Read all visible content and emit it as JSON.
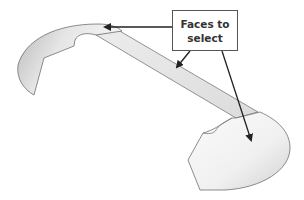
{
  "diagram": {
    "callout": {
      "line1": "Faces to",
      "line2": "select"
    },
    "colors": {
      "face_fill_light": "#f7f7f7",
      "face_fill_dark": "#bdbdbd",
      "edge": "#6e6e6e",
      "arrow": "#222222",
      "callout_border": "#555555",
      "callout_text": "#333333"
    },
    "arrows": [
      {
        "name": "arrow-to-left-face",
        "from": [
          172,
          27
        ],
        "to": [
          103,
          27
        ]
      },
      {
        "name": "arrow-to-middle-face",
        "from": [
          190,
          51
        ],
        "to": [
          176,
          68
        ]
      },
      {
        "name": "arrow-to-right-face",
        "from": [
          222,
          51
        ],
        "to": [
          252,
          142
        ]
      }
    ]
  }
}
